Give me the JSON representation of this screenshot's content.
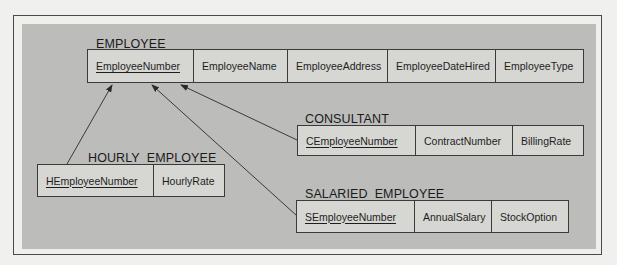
{
  "colors": {
    "page_background": "#f0f0ee",
    "panel_background": "#bcbcba",
    "table_fill": "#d6d6d3",
    "line_color": "#3a3a3a"
  },
  "entities": [
    {
      "name": "EMPLOYEE",
      "attributes": [
        {
          "label": "EmployeeNumber",
          "primary_key": true
        },
        {
          "label": "EmployeeName",
          "primary_key": false
        },
        {
          "label": "EmployeeAddress",
          "primary_key": false
        },
        {
          "label": "EmployeeDateHired",
          "primary_key": false
        },
        {
          "label": "EmployeeType",
          "primary_key": false
        }
      ]
    },
    {
      "name": "CONSULTANT",
      "attributes": [
        {
          "label": "CEmployeeNumber",
          "primary_key": true
        },
        {
          "label": "ContractNumber",
          "primary_key": false
        },
        {
          "label": "BillingRate",
          "primary_key": false
        }
      ]
    },
    {
      "name": "HOURLY_EMPLOYEE",
      "attributes": [
        {
          "label": "HEmployeeNumber",
          "primary_key": true
        },
        {
          "label": "HourlyRate",
          "primary_key": false
        }
      ]
    },
    {
      "name": "SALARIED_EMPLOYEE",
      "attributes": [
        {
          "label": "SEmployeeNumber",
          "primary_key": true
        },
        {
          "label": "AnnualSalary",
          "primary_key": false
        },
        {
          "label": "StockOption",
          "primary_key": false
        }
      ]
    }
  ],
  "relationships": [
    {
      "from": "HOURLY_EMPLOYEE.HEmployeeNumber",
      "to": "EMPLOYEE.EmployeeNumber"
    },
    {
      "from": "SALARIED_EMPLOYEE.SEmployeeNumber",
      "to": "EMPLOYEE.EmployeeNumber"
    },
    {
      "from": "CONSULTANT.CEmployeeNumber",
      "to": "EMPLOYEE.EmployeeNumber"
    }
  ]
}
